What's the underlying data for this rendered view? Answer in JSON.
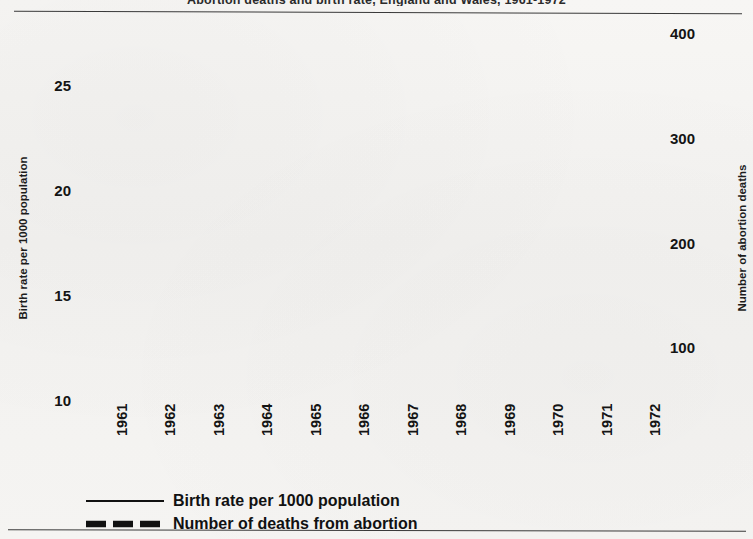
{
  "figure": {
    "title": "Abortion deaths and birth rate, England and Wales, 1961-1972",
    "background_color": "#f4f3f1",
    "ink_color": "#141414"
  },
  "axes": {
    "left": {
      "title": "Birth rate per 1000 population",
      "tick_labels": [
        "10",
        "15",
        "20",
        "25"
      ],
      "tick_values": [
        10,
        15,
        20,
        25
      ],
      "min": 8.75,
      "max": 27.5
    },
    "right": {
      "title": "Number of abortion deaths",
      "tick_labels": [
        "100",
        "200",
        "300",
        "400"
      ],
      "tick_values": [
        100,
        200,
        300,
        400
      ],
      "minor_tick_values": [
        50,
        150,
        250,
        350
      ],
      "min": 25,
      "max": 400
    },
    "x": {
      "tick_labels": [
        "1961",
        "1962",
        "1963",
        "1964",
        "1965",
        "1966",
        "1967",
        "1968",
        "1969",
        "1970",
        "1971",
        "1972"
      ]
    }
  },
  "legend": {
    "items": [
      {
        "label": "Birth rate per 1000 population",
        "style": "thin-solid",
        "key_name": "legend-key-birth-rate"
      },
      {
        "label": "Number of deaths from abortion",
        "style": "thick-dashed",
        "key_name": "legend-key-abortion-deaths"
      }
    ]
  },
  "chart_data": {
    "type": "line",
    "title": "Abortion deaths and birth rate, England and Wales, 1961-1972",
    "xlabel": "",
    "ylabel": "Birth rate per 1000 population",
    "y2label": "Number of abortion deaths",
    "grid": true,
    "legend_position": "below-axis",
    "x": [
      1961,
      1962,
      1963,
      1964,
      1965,
      1966,
      1967,
      1968,
      1969,
      1970,
      1971,
      1972
    ],
    "categories": [
      "1961",
      "1962",
      "1963",
      "1964",
      "1965",
      "1966",
      "1967",
      "1968",
      "1969",
      "1970",
      "1971",
      "1972"
    ],
    "ylim": [
      8.75,
      27.5
    ],
    "y2lim": [
      25,
      400
    ],
    "series": [
      {
        "name": "Birth rate per 1000 population",
        "axis": "left",
        "style": "thin-solid",
        "values": [
          17.8,
          16.2,
          15.7,
          15.1,
          14.6,
          14.0,
          27.5,
          26.8,
          22.2,
          18.7,
          16.2,
          15.6
        ]
      },
      {
        "name": "Number of deaths from abortion",
        "axis": "right",
        "style": "thick-dashed",
        "values": [
          137,
          83,
          84,
          70,
          62,
          74,
          166,
          212,
          254,
          302,
          360,
          368
        ]
      }
    ],
    "annotations": []
  }
}
